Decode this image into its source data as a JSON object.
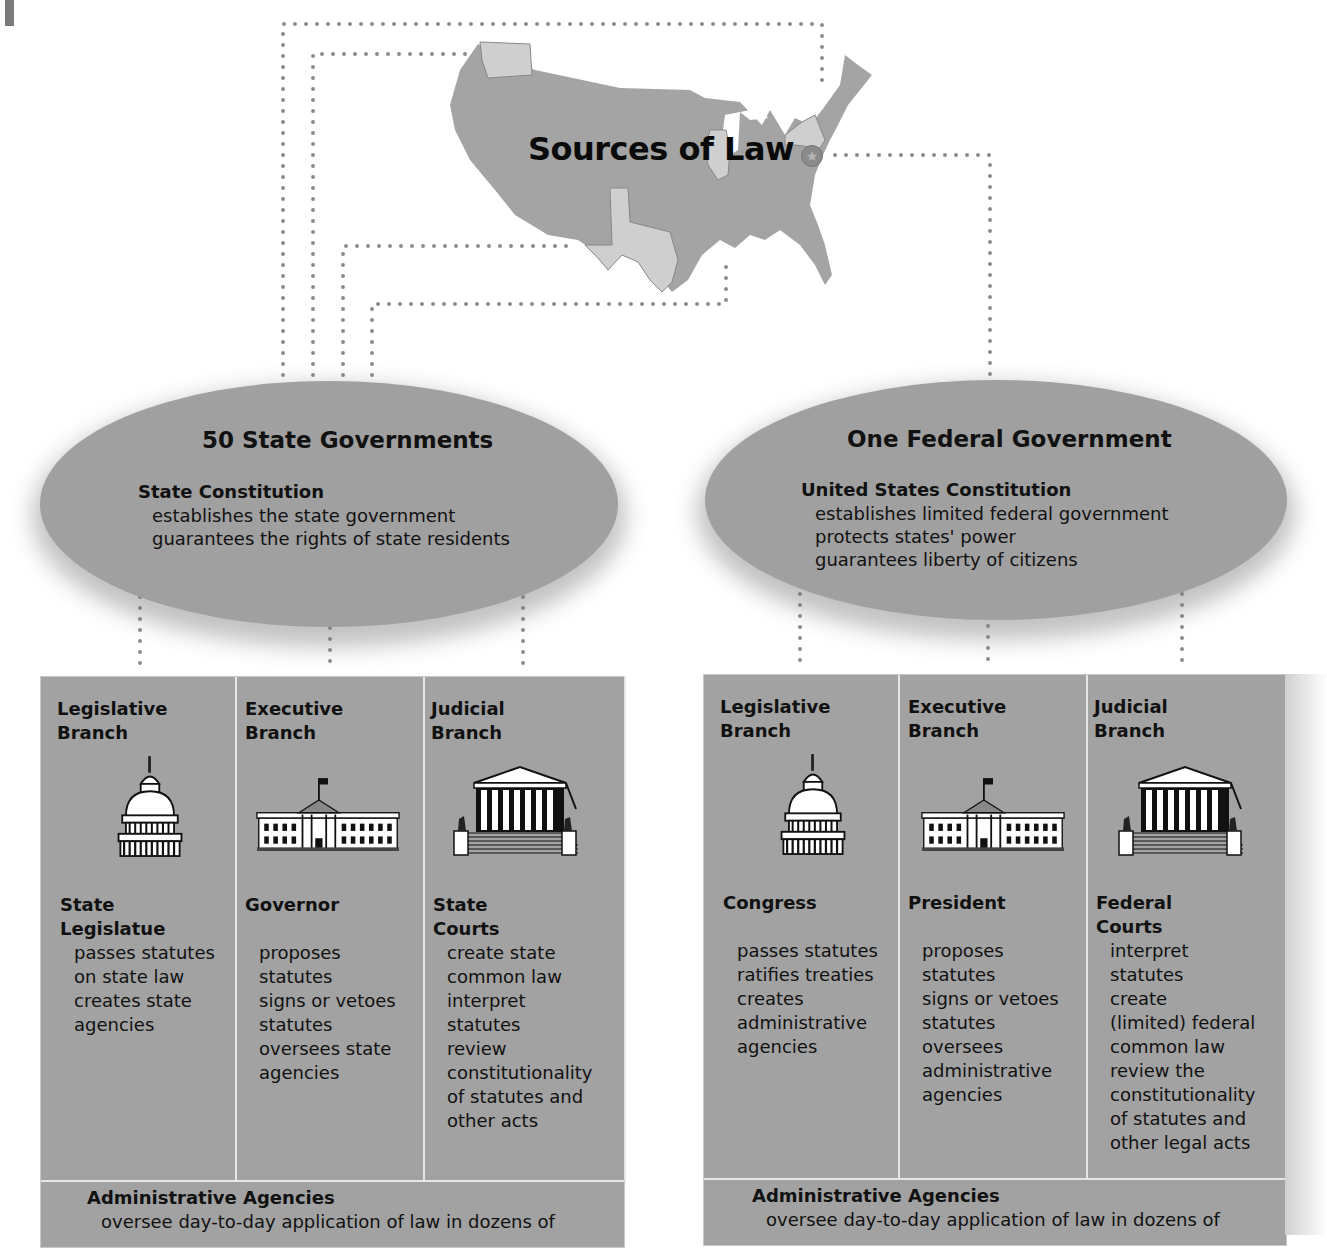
{
  "title": "Sources of Law",
  "colors": {
    "oval_fill": "#a0a0a0",
    "panel_fill": "#a2a2a2",
    "map_fill": "#a4a4a4",
    "highlight_state_fill": "#cfcfcf",
    "connector_dots": "#8c8c8c",
    "divider": "#e6e6e6",
    "text": "#111111"
  },
  "map": {
    "highlighted_states": [
      "Washington",
      "Texas",
      "Illinois",
      "New York"
    ],
    "capital_marker": "star-seal"
  },
  "state": {
    "title": "50 State Governments",
    "constitution": {
      "title": "State Constitution",
      "lines": [
        "establishes the state government",
        "guarantees the rights of state residents"
      ]
    },
    "branches": [
      {
        "title": "Legislative\nBranch",
        "icon": "capitol-dome-icon",
        "actor": "State\nLegislatue",
        "duties": "passes statutes\non state law\ncreates state\nagencies"
      },
      {
        "title": "Executive\nBranch",
        "icon": "white-house-icon",
        "actor": "Governor",
        "duties": "proposes\nstatutes\nsigns or vetoes\nstatutes\noversees state\nagencies"
      },
      {
        "title": "Judicial\nBranch",
        "icon": "supreme-court-icon",
        "actor": "State\nCourts",
        "duties": "create state\ncommon law\ninterpret\nstatutes\nreview\nconstitutionality\nof statutes and\nother acts"
      }
    ],
    "agencies": {
      "title": "Administrative Agencies",
      "text": "oversee day-to-day application of law in dozens of"
    }
  },
  "federal": {
    "title": "One Federal Government",
    "constitution": {
      "title": "United States Constitution",
      "lines": [
        "establishes limited federal government",
        "protects states' power",
        "guarantees liberty of citizens"
      ]
    },
    "branches": [
      {
        "title": "Legislative\nBranch",
        "icon": "capitol-dome-icon",
        "actor": "Congress",
        "duties": "passes statutes\nratifies treaties\ncreates\nadministrative\nagencies"
      },
      {
        "title": "Executive\nBranch",
        "icon": "white-house-icon",
        "actor": "President",
        "duties": "proposes\nstatutes\nsigns or vetoes\nstatutes\noversees\nadministrative\nagencies"
      },
      {
        "title": "Judicial\nBranch",
        "icon": "supreme-court-icon",
        "actor": "Federal\nCourts",
        "duties": "interpret\nstatutes\ncreate\n(limited) federal\ncommon law\nreview the\nconstitutionality\nof statutes and\nother legal acts"
      }
    ],
    "agencies": {
      "title": "Administrative Agencies",
      "text": "oversee day-to-day application of law in dozens of"
    }
  }
}
